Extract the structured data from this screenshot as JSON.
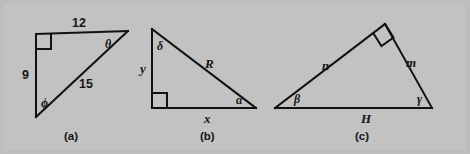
{
  "figure": {
    "background_color": "#bdbdbd",
    "line_color": "#111111",
    "text_color": "#151515",
    "width": 470,
    "height": 154
  },
  "panels": [
    {
      "id": "a",
      "caption": "(a)",
      "caption_x": 64,
      "caption_y": 131,
      "description": "right triangle with legs 9 and 12, hypotenuse 15, angles theta and phi",
      "vertices": {
        "top_left": [
          36,
          34
        ],
        "top_right": [
          128,
          31
        ],
        "bottom_left": [
          36,
          117
        ]
      },
      "right_angle_at": "top_left",
      "labels": [
        {
          "name": "side-12",
          "text": "12",
          "kind": "side",
          "x": 72,
          "y": 17
        },
        {
          "name": "side-9",
          "text": "9",
          "kind": "side",
          "x": 22,
          "y": 69
        },
        {
          "name": "side-15",
          "text": "15",
          "kind": "side",
          "x": 79,
          "y": 78
        },
        {
          "name": "angle-theta",
          "text": "θ",
          "kind": "angle",
          "x": 105,
          "y": 38
        },
        {
          "name": "angle-phi",
          "text": "ϕ",
          "kind": "angle",
          "x": 41,
          "y": 97
        }
      ]
    },
    {
      "id": "b",
      "caption": "(b)",
      "caption_x": 200,
      "caption_y": 131,
      "description": "right triangle with vertical leg y, horizontal leg x, hypotenuse R, angles delta and alpha",
      "vertices": {
        "top_left": [
          152,
          29
        ],
        "bottom_left": [
          152,
          108
        ],
        "bottom_right": [
          256,
          108
        ]
      },
      "right_angle_at": "bottom_left",
      "labels": [
        {
          "name": "side-y",
          "text": "y",
          "kind": "var",
          "x": 140,
          "y": 62
        },
        {
          "name": "side-x",
          "text": "x",
          "kind": "var",
          "x": 204,
          "y": 112
        },
        {
          "name": "side-R",
          "text": "R",
          "kind": "var",
          "x": 205,
          "y": 57
        },
        {
          "name": "angle-delta",
          "text": "δ",
          "kind": "angle",
          "x": 157,
          "y": 40
        },
        {
          "name": "angle-alpha",
          "text": "α",
          "kind": "angle",
          "x": 236,
          "y": 94
        }
      ]
    },
    {
      "id": "c",
      "caption": "(c)",
      "caption_x": 355,
      "caption_y": 131,
      "description": "right triangle with base H, sides n and m, right angle at apex, angles beta and gamma",
      "vertices": {
        "apex": [
          385,
          24
        ],
        "bottom_left": [
          275,
          108
        ],
        "bottom_right": [
          432,
          108
        ]
      },
      "right_angle_at": "apex",
      "labels": [
        {
          "name": "side-n",
          "text": "n",
          "kind": "var",
          "x": 322,
          "y": 59
        },
        {
          "name": "side-m",
          "text": "m",
          "kind": "var",
          "x": 406,
          "y": 56
        },
        {
          "name": "side-H",
          "text": "H",
          "kind": "var",
          "x": 361,
          "y": 112
        },
        {
          "name": "angle-beta",
          "text": "β",
          "kind": "angle",
          "x": 294,
          "y": 93
        },
        {
          "name": "angle-gamma",
          "text": "γ",
          "kind": "angle",
          "x": 417,
          "y": 93
        }
      ]
    }
  ]
}
